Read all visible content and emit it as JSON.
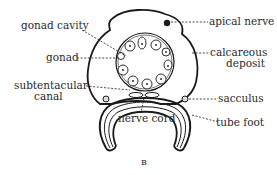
{
  "figure": {
    "panel_letter": "B",
    "labels": {
      "gonad_cavity": "gonad cavity",
      "gonad": "gonad",
      "subtentacular_canal_line1": "subtentacular",
      "subtentacular_canal_line2": "canal",
      "apical_nerve": "apical nerve",
      "calcareous_deposit_line1": "calcareous",
      "calcareous_deposit_line2": "deposit",
      "sacculus": "sacculus",
      "nerve_cord": "nerve cord",
      "tube_foot": "tube foot"
    },
    "colors": {
      "ink": "#1a1a1a",
      "background": "#ffffff"
    }
  }
}
